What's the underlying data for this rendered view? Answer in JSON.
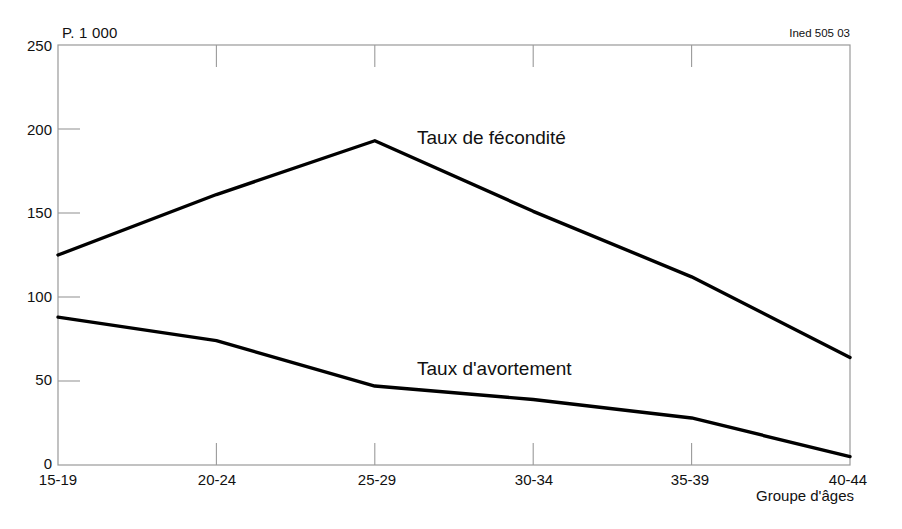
{
  "chart_data": {
    "type": "line",
    "title": "",
    "subtitle": "",
    "unit_note": "P. 1 000",
    "source": "Ined 505 03",
    "xlabel": "Groupe d'âges",
    "ylabel": "",
    "categories": [
      "15-19",
      "20-24",
      "25-29",
      "30-34",
      "35-39",
      "40-44"
    ],
    "ylim": [
      0,
      250
    ],
    "yticks": [
      0,
      50,
      100,
      150,
      200,
      250
    ],
    "grid": true,
    "legend_position": "inline-annotation",
    "series": [
      {
        "name": "Taux de fécondité",
        "values": [
          125,
          161,
          193,
          151,
          112,
          64
        ],
        "color": "#000000"
      },
      {
        "name": "Taux d'avortement",
        "values": [
          88,
          74,
          47,
          39,
          28,
          5
        ],
        "color": "#000000"
      }
    ],
    "annotations": [
      {
        "text": "Taux de fécondité",
        "x": "25-29",
        "y": 193
      },
      {
        "text": "Taux d'avortement",
        "x": "30-34",
        "y": 47
      }
    ]
  },
  "axes": {
    "y_tick_labels": [
      "250",
      "200",
      "150",
      "100",
      "50",
      "0"
    ],
    "x_tick_labels": [
      "15-19",
      "20-24",
      "25-29",
      "30-34",
      "35-39",
      "40-44"
    ]
  },
  "colors": {
    "line": "#000000",
    "frame": "#999999",
    "grid": "#9a9a9a",
    "text": "#111111",
    "background": "#ffffff"
  }
}
